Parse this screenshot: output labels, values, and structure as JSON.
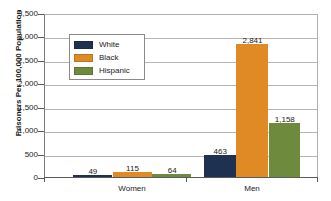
{
  "chart_data": {
    "type": "bar",
    "title": "",
    "xlabel": "",
    "ylabel": "Prisoners Per 100,000 Population",
    "categories": [
      "Women",
      "Men"
    ],
    "series": [
      {
        "name": "White",
        "color": "#1f3150",
        "values": [
          49,
          463
        ],
        "labels": [
          "49",
          "463"
        ]
      },
      {
        "name": "Black",
        "color": "#e08a25",
        "values": [
          115,
          2841
        ],
        "labels": [
          "115",
          "2,841"
        ]
      },
      {
        "name": "Hispanic",
        "color": "#6e8b3d",
        "values": [
          64,
          1158
        ],
        "labels": [
          "64",
          "1,158"
        ]
      }
    ],
    "ylim": [
      0,
      3500
    ],
    "ytick_values": [
      0,
      500,
      1000,
      1500,
      2000,
      2500,
      3000,
      3500
    ],
    "ytick_labels": [
      "0",
      "500",
      "1,000",
      "1,500",
      "2,000",
      "2,500",
      "3,000",
      "3,500"
    ],
    "grid": true,
    "legend_position": "upper-left",
    "legend_entries": [
      "White",
      "Black",
      "Hispanic"
    ]
  }
}
